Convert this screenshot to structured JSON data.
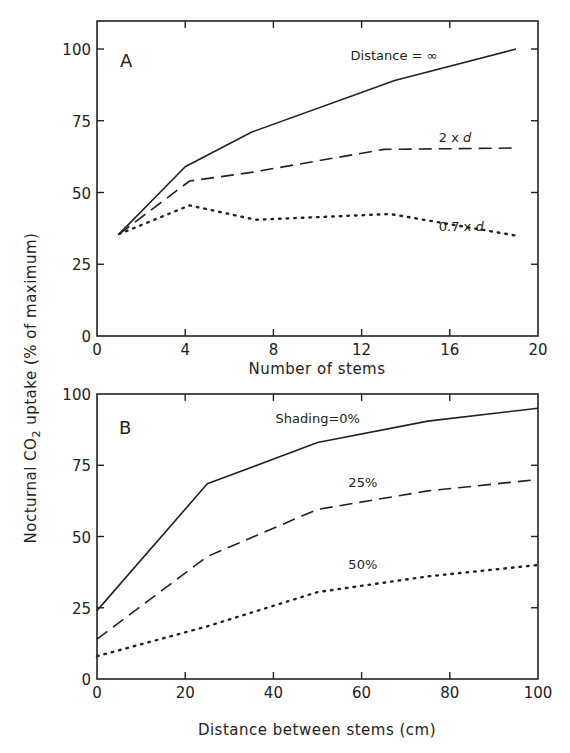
{
  "figure": {
    "ylabel": "Nocturnal CO2 uptake  (% of maximum)",
    "ylabel_parts": {
      "pre": "Nocturnal  CO",
      "sub": "2",
      "post": "  uptake   (% of maximum)"
    }
  },
  "chart_data": [
    {
      "panel": "A",
      "type": "line",
      "title": "",
      "xlabel": "Number of stems",
      "ylabel": "Nocturnal CO2 uptake (% of maximum)",
      "xlim": [
        0,
        20
      ],
      "ylim": [
        0,
        100
      ],
      "xticks": [
        0,
        4,
        8,
        12,
        16,
        20
      ],
      "yticks": [
        0,
        25,
        50,
        75,
        100
      ],
      "grid": false,
      "legend": "inline labels",
      "series": [
        {
          "name": "Distance = ∞",
          "style": "solid",
          "x": [
            1,
            4,
            7,
            13.5,
            19
          ],
          "y": [
            35.5,
            59,
            71,
            89,
            100
          ]
        },
        {
          "name": "2 x d",
          "style": "dashed",
          "x": [
            1,
            4.2,
            7,
            13,
            19
          ],
          "y": [
            35.5,
            54,
            57,
            65,
            65.5
          ]
        },
        {
          "name": "0.7 x d",
          "style": "dotted",
          "x": [
            1,
            4.2,
            7.2,
            13.3,
            19
          ],
          "y": [
            35.5,
            45.5,
            40.5,
            42.5,
            35
          ]
        }
      ],
      "labels": [
        {
          "text": "Distance = ∞",
          "x": 11.5,
          "y": 96
        },
        {
          "text": "2 x d",
          "x": 15.5,
          "y": 67.5
        },
        {
          "text": "0.7 x d",
          "x": 15.5,
          "y": 36.5
        }
      ]
    },
    {
      "panel": "B",
      "type": "line",
      "title": "",
      "xlabel": "Distance between stems (cm)",
      "ylabel": "Nocturnal CO2 uptake (% of maximum)",
      "xlim": [
        0,
        100
      ],
      "ylim": [
        0,
        100
      ],
      "xticks": [
        0,
        20,
        40,
        60,
        80,
        100
      ],
      "yticks": [
        0,
        25,
        50,
        75,
        100
      ],
      "grid": false,
      "legend": "inline labels",
      "series": [
        {
          "name": "Shading = 0%",
          "style": "solid",
          "x": [
            0,
            25,
            50,
            75,
            100
          ],
          "y": [
            24,
            68.5,
            83,
            90.5,
            95
          ]
        },
        {
          "name": "25%",
          "style": "dashed",
          "x": [
            0,
            25,
            50,
            75,
            100
          ],
          "y": [
            14,
            43,
            59.5,
            66,
            70
          ]
        },
        {
          "name": "50%",
          "style": "dotted",
          "x": [
            0,
            25,
            50,
            75,
            100
          ],
          "y": [
            8,
            18.5,
            30.5,
            36,
            40
          ]
        }
      ],
      "labels": [
        {
          "text": "Shading=0%",
          "x": 40.5,
          "y": 90
        },
        {
          "text": "25%",
          "x": 57,
          "y": 67.5
        },
        {
          "text": "50%",
          "x": 57,
          "y": 38.5
        }
      ]
    }
  ]
}
